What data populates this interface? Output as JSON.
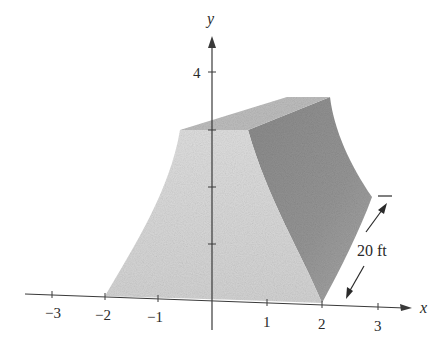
{
  "figure": {
    "axes": {
      "x_label": "x",
      "y_label": "y",
      "x_ticks": [
        {
          "value": -3,
          "label": "−3"
        },
        {
          "value": -2,
          "label": "−2"
        },
        {
          "value": -1,
          "label": "−1"
        },
        {
          "value": 1,
          "label": "1"
        },
        {
          "value": 2,
          "label": "2"
        },
        {
          "value": 3,
          "label": "3"
        }
      ],
      "y_ticks": [
        {
          "value": 1,
          "label": ""
        },
        {
          "value": 2,
          "label": ""
        },
        {
          "value": 3,
          "label": ""
        },
        {
          "value": 4,
          "label": "4"
        }
      ]
    },
    "dimension": {
      "label": "20 ft"
    },
    "colors": {
      "axis": "#3a3a3a",
      "front_face": "#d9d9d9",
      "top_face": "#b9b9b9",
      "side_face": "#8f8f8f",
      "text": "#2a2a2a"
    }
  }
}
